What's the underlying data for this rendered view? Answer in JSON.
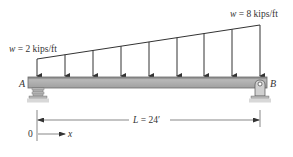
{
  "diagram": {
    "type": "simply-supported beam with linearly varying distributed load",
    "load_left_label": "w = 2 kips/ft",
    "load_right_label": "w = 8 kips/ft",
    "support_left_label": "A",
    "support_right_label": "B",
    "span_label": "L = 24′",
    "origin_label": "0",
    "axis_label": "x",
    "load_arrow_count": 9,
    "colors": {
      "beam_fill": "#a9a9a9",
      "beam_edge": "#6b6b6b",
      "line": "#333333",
      "support_fill": "#bdbdbd"
    }
  }
}
